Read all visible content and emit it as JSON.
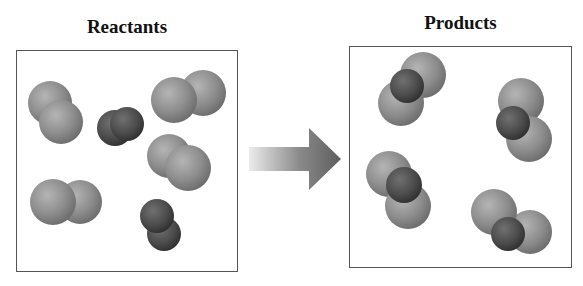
{
  "diagram": {
    "left_panel": {
      "title": "Reactants",
      "molecules": [
        {
          "kind": "light-diatomic",
          "atoms": [
            {
              "cx": 50,
              "cy": 103,
              "r": 22,
              "tone": "light"
            },
            {
              "cx": 61,
              "cy": 122,
              "r": 22,
              "tone": "light"
            }
          ]
        },
        {
          "kind": "dark-diatomic",
          "atoms": [
            {
              "cx": 115,
              "cy": 128,
              "r": 18,
              "tone": "dark"
            },
            {
              "cx": 127,
              "cy": 124,
              "r": 17,
              "tone": "dark"
            }
          ]
        },
        {
          "kind": "light-diatomic",
          "atoms": [
            {
              "cx": 203,
              "cy": 93,
              "r": 23,
              "tone": "light"
            },
            {
              "cx": 174,
              "cy": 100,
              "r": 23,
              "tone": "light"
            }
          ]
        },
        {
          "kind": "light-diatomic",
          "atoms": [
            {
              "cx": 169,
              "cy": 156,
              "r": 22,
              "tone": "light"
            },
            {
              "cx": 188,
              "cy": 168,
              "r": 23,
              "tone": "light"
            }
          ]
        },
        {
          "kind": "light-diatomic",
          "atoms": [
            {
              "cx": 80,
              "cy": 202,
              "r": 22,
              "tone": "light"
            },
            {
              "cx": 53,
              "cy": 202,
              "r": 23,
              "tone": "light"
            }
          ]
        },
        {
          "kind": "dark-diatomic",
          "atoms": [
            {
              "cx": 164,
              "cy": 234,
              "r": 17,
              "tone": "dark"
            },
            {
              "cx": 157,
              "cy": 216,
              "r": 17,
              "tone": "dark"
            }
          ]
        }
      ]
    },
    "arrow": {
      "direction": "right",
      "meaning": "reaction-arrow"
    },
    "right_panel": {
      "title": "Products",
      "molecules": [
        {
          "kind": "triatomic",
          "atoms": [
            {
              "cx": 423,
              "cy": 75,
              "r": 23,
              "tone": "light"
            },
            {
              "cx": 401,
              "cy": 103,
              "r": 23,
              "tone": "light"
            },
            {
              "cx": 407,
              "cy": 86,
              "r": 17,
              "tone": "dark"
            }
          ]
        },
        {
          "kind": "triatomic",
          "atoms": [
            {
              "cx": 521,
              "cy": 101,
              "r": 23,
              "tone": "light"
            },
            {
              "cx": 529,
              "cy": 139,
              "r": 23,
              "tone": "light"
            },
            {
              "cx": 513,
              "cy": 123,
              "r": 17,
              "tone": "dark"
            }
          ]
        },
        {
          "kind": "triatomic",
          "atoms": [
            {
              "cx": 389,
              "cy": 174,
              "r": 23,
              "tone": "light"
            },
            {
              "cx": 408,
              "cy": 206,
              "r": 23,
              "tone": "light"
            },
            {
              "cx": 404,
              "cy": 185,
              "r": 18,
              "tone": "dark"
            }
          ]
        },
        {
          "kind": "triatomic",
          "atoms": [
            {
              "cx": 530,
              "cy": 232,
              "r": 22,
              "tone": "light"
            },
            {
              "cx": 494,
              "cy": 212,
              "r": 23,
              "tone": "light"
            },
            {
              "cx": 508,
              "cy": 234,
              "r": 17,
              "tone": "dark"
            }
          ]
        }
      ]
    },
    "colors": {
      "light_atom": "#8a8a8a",
      "light_atom_highlight": "#b2b2b2",
      "dark_atom": "#4a4a4a",
      "dark_atom_highlight": "#6e6e6e",
      "arrow_dark": "#6a6a6a",
      "arrow_light": "#e6e6e6",
      "box_border": "#555555"
    }
  }
}
